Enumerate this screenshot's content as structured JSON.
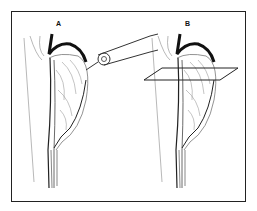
{
  "figure": {
    "panels": [
      {
        "label": "A",
        "annotation": "endoscope-probe"
      },
      {
        "label": "B",
        "annotation": "cross-section-plane"
      }
    ],
    "colors": {
      "line": "#222222",
      "vessel": "#555555",
      "background": "#ffffff"
    }
  }
}
